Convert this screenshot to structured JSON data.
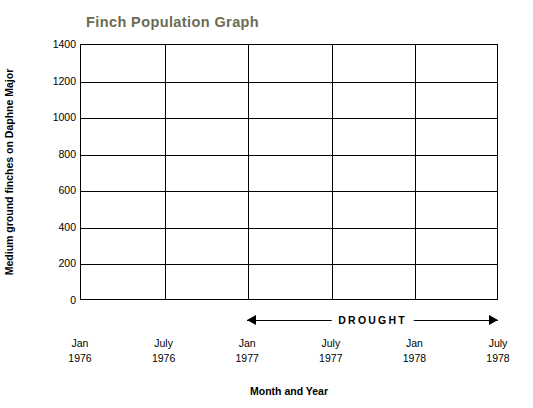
{
  "chart_data": {
    "type": "line",
    "title": "Finch Population Graph",
    "xlabel": "Month and Year",
    "ylabel": "Medium ground finches on Daphne Major",
    "ylim": [
      0,
      1400
    ],
    "yticks": [
      0,
      200,
      400,
      600,
      800,
      1000,
      1200,
      1400
    ],
    "grid": "horizontal-and-vertical",
    "categories": [
      "Jan\n1976",
      "July\n1976",
      "Jan\n1977",
      "July\n1977",
      "Jan\n1978",
      "July\n1978"
    ],
    "xtick_labels": [
      {
        "month": "Jan",
        "year": "1976"
      },
      {
        "month": "July",
        "year": "1976"
      },
      {
        "month": "Jan",
        "year": "1977"
      },
      {
        "month": "July",
        "year": "1977"
      },
      {
        "month": "Jan",
        "year": "1978"
      },
      {
        "month": "July",
        "year": "1978"
      }
    ],
    "series": [],
    "annotations": [
      {
        "label": "DROUGHT",
        "type": "double-arrow-span",
        "from": "Jan 1977",
        "to": "July 1978"
      }
    ],
    "legend": null,
    "colors": {
      "title": "#6b6b52",
      "axis": "#000000",
      "background": "#ffffff"
    }
  }
}
